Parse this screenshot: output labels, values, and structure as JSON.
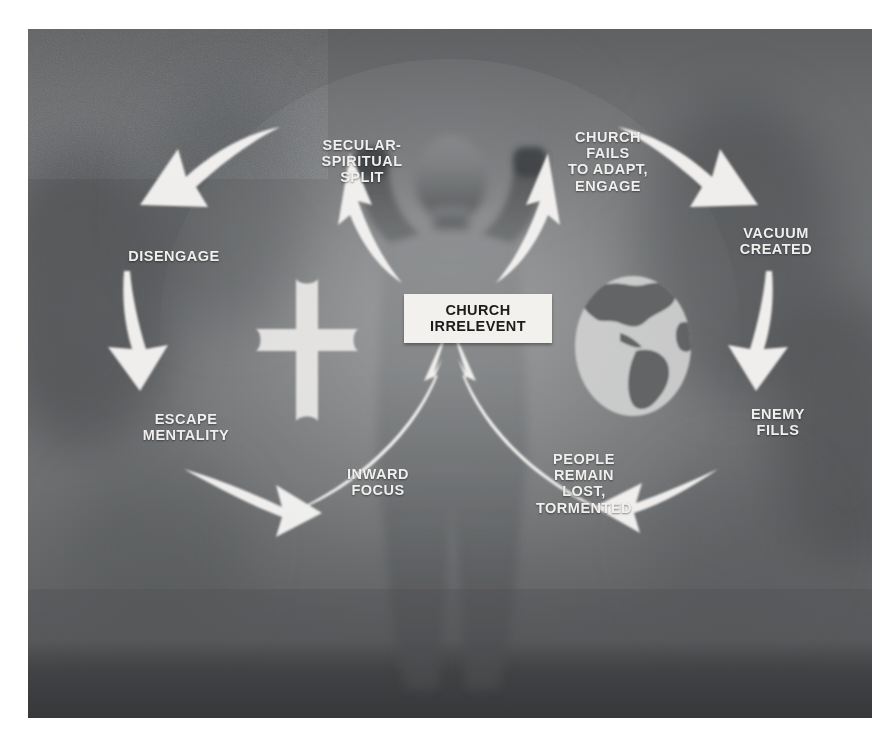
{
  "diagram": {
    "title_label": {
      "line1": "CHURCH",
      "line2": "IRRELEVENT"
    },
    "palette": {
      "panel_bg": "#6f7173",
      "label_bg": "#f2f1ee",
      "label_text": "#1c1c1c",
      "node_text": "#f0efee",
      "arrow_fill": "#f4f3f1",
      "page_bg": "#ffffff"
    },
    "emblems": [
      {
        "name": "cross",
        "label": "cross"
      },
      {
        "name": "globe",
        "label": "globe"
      },
      {
        "name": "figure",
        "label": "person-with-raised-arms-silhouette"
      }
    ],
    "nodes": [
      {
        "id": "secular-spiritual-split",
        "text": "SECULAR-\nSPIRITUAL\nSPLIT",
        "x": 274,
        "y": 108,
        "w": 120
      },
      {
        "id": "church-fails-to-adapt-engage",
        "text": "CHURCH\nFAILS\nTO ADAPT,\nENGAGE",
        "x": 521,
        "y": 100,
        "w": 118
      },
      {
        "id": "vacuum-created",
        "text": "VACUUM\nCREATED",
        "x": 694,
        "y": 196,
        "w": 108
      },
      {
        "id": "enemy-fills",
        "text": "ENEMY\nFILLS",
        "x": 702,
        "y": 377,
        "w": 96
      },
      {
        "id": "people-remain-lost-tormented",
        "text": "PEOPLE\nREMAIN\nLOST,\nTORMENTED",
        "x": 495,
        "y": 422,
        "w": 122
      },
      {
        "id": "inward-focus",
        "text": "INWARD\nFOCUS",
        "x": 299,
        "y": 437,
        "w": 102
      },
      {
        "id": "escape-mentality",
        "text": "ESCAPE\nMENTALITY",
        "x": 98,
        "y": 382,
        "w": 120
      },
      {
        "id": "disengage",
        "text": "DISENGAGE",
        "x": 83,
        "y": 219,
        "w": 126
      }
    ],
    "arrows": [
      {
        "id": "arrow-center-to-secular-spiritual-split",
        "from": "CHURCH IRRELEVENT",
        "to": "SECULAR-SPIRITUAL SPLIT",
        "direction": "up-left"
      },
      {
        "id": "arrow-center-to-church-fails",
        "from": "CHURCH IRRELEVENT",
        "to": "CHURCH FAILS TO ADAPT, ENGAGE",
        "direction": "up-right"
      },
      {
        "id": "arrow-split-to-disengage",
        "from": "SECULAR-SPIRITUAL SPLIT",
        "to": "DISENGAGE",
        "direction": "left-down"
      },
      {
        "id": "arrow-disengage-to-escape-mentality",
        "from": "DISENGAGE",
        "to": "ESCAPE MENTALITY",
        "direction": "down"
      },
      {
        "id": "arrow-escape-to-inward-focus",
        "from": "ESCAPE MENTALITY",
        "to": "INWARD FOCUS",
        "direction": "right"
      },
      {
        "id": "arrow-inward-focus-to-center",
        "from": "INWARD FOCUS",
        "to": "CHURCH IRRELEVENT",
        "direction": "up-right"
      },
      {
        "id": "arrow-people-lost-to-center",
        "from": "PEOPLE REMAIN LOST, TORMENTED",
        "to": "CHURCH IRRELEVENT",
        "direction": "up-left"
      },
      {
        "id": "arrow-church-fails-to-vacuum",
        "from": "CHURCH FAILS TO ADAPT, ENGAGE",
        "to": "VACUUM CREATED",
        "direction": "right-down"
      },
      {
        "id": "arrow-vacuum-to-enemy-fills",
        "from": "VACUUM CREATED",
        "to": "ENEMY FILLS",
        "direction": "down"
      },
      {
        "id": "arrow-enemy-fills-to-people-lost",
        "from": "ENEMY FILLS",
        "to": "PEOPLE REMAIN LOST, TORMENTED",
        "direction": "left"
      }
    ]
  }
}
